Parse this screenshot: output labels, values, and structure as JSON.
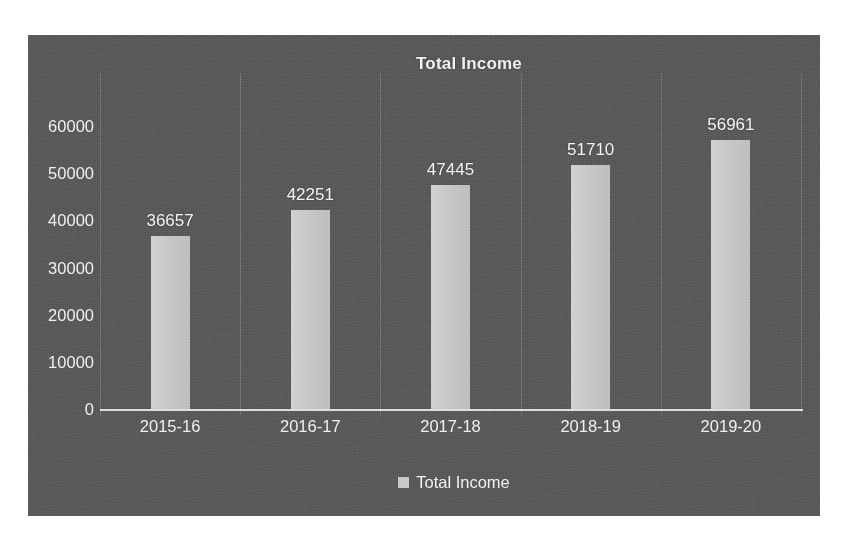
{
  "chart_data": {
    "type": "bar",
    "title": "Total Income",
    "xlabel": "",
    "ylabel": "",
    "categories": [
      "2015-16",
      "2016-17",
      "2017-18",
      "2018-19",
      "2019-20"
    ],
    "values": [
      36657,
      42251,
      47445,
      51710,
      56961
    ],
    "series": [
      {
        "name": "Total Income",
        "values": [
          36657,
          42251,
          47445,
          51710,
          56961
        ]
      }
    ],
    "data_labels": [
      "36657",
      "42251",
      "47445",
      "51710",
      "56961"
    ],
    "ylim": [
      0,
      60000
    ],
    "ytick_values": [
      0,
      10000,
      20000,
      30000,
      40000,
      50000,
      60000
    ],
    "ytick_labels": [
      "0",
      "10000",
      "20000",
      "30000",
      "40000",
      "50000",
      "60000"
    ],
    "grid": {
      "horizontal": false,
      "vertical": true
    },
    "legend": {
      "position": "bottom",
      "entries": [
        {
          "label": "Total Income",
          "swatch_color": "#c9c9c9",
          "swatch_shape": "square"
        }
      ]
    },
    "colors": {
      "plot_background": "#5a5a5a",
      "page_background": "#ffffff",
      "bar_fill": "#c9c9c9",
      "text": "#f1f1f1",
      "axis_line": "#ffffff",
      "gridline": "#8c8c8c"
    }
  }
}
